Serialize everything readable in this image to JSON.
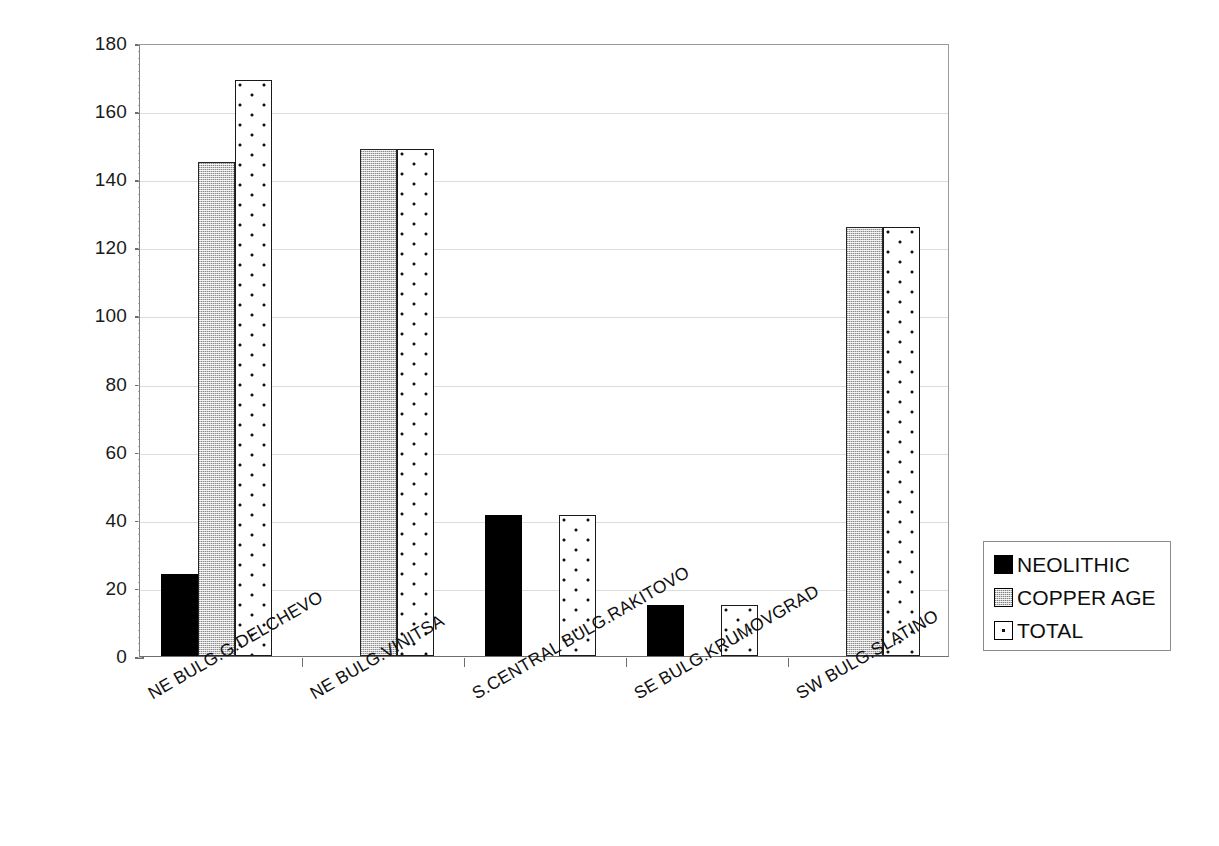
{
  "chart_data": {
    "type": "bar",
    "title": "",
    "subtitle": "",
    "xlabel": "",
    "ylabel": "",
    "ylim": [
      0,
      180
    ],
    "ytick_step": 20,
    "yticks": [
      0,
      20,
      40,
      60,
      80,
      100,
      120,
      140,
      160,
      180
    ],
    "grid": true,
    "legend_position": "right",
    "categories": [
      "NE BULG.G.DELCHEVO",
      "NE BULG.VINITSA",
      "S.CENTRAL BULG.RAKITOVO",
      "SE BULG.KRUMOVGRAD",
      "SW BULG.SLATINO"
    ],
    "series": [
      {
        "name": "NEOLITHIC",
        "values": [
          24,
          0,
          41.5,
          15,
          0
        ]
      },
      {
        "name": "COPPER AGE",
        "values": [
          145,
          149,
          0,
          0,
          126
        ]
      },
      {
        "name": "TOTAL",
        "values": [
          169,
          149,
          41.5,
          15,
          126
        ]
      }
    ],
    "colors": {
      "neolithic": "#000000",
      "copper_age": "#c9c9c9",
      "total": "#ffffff",
      "gridline": "#dcdcdc",
      "axis": "#6e6e6e",
      "text": "#111111"
    }
  },
  "legend": {
    "entries": [
      {
        "label": "NEOLITHIC",
        "pattern": "solid-black-swatch"
      },
      {
        "label": "COPPER AGE",
        "pattern": "gray-stipple-swatch"
      },
      {
        "label": "TOTAL",
        "pattern": "white-dotted-swatch"
      }
    ]
  },
  "axis": {
    "y_tick_labels": [
      "180",
      "160",
      "140",
      "120",
      "100",
      "80",
      "60",
      "40",
      "20",
      "0"
    ]
  }
}
